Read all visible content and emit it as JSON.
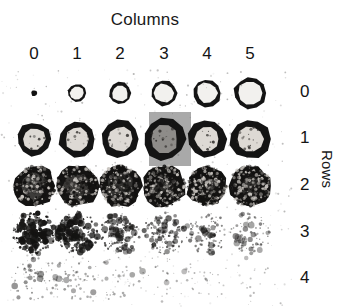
{
  "figure": {
    "width": 340,
    "height": 308,
    "background": "#ffffff",
    "ink": "#141414",
    "highlight_color": "#a9a9a9"
  },
  "axes": {
    "columns_title": "Columns",
    "rows_title": "Rows",
    "column_labels": [
      "0",
      "1",
      "2",
      "3",
      "4",
      "5"
    ],
    "row_labels": [
      "0",
      "1",
      "2",
      "3",
      "4"
    ]
  },
  "highlight": {
    "row": 1,
    "column": 3,
    "x": 149,
    "y": 112,
    "width": 42,
    "height": 54,
    "color": "#a9a9a9"
  },
  "layout": {
    "column_x": [
      34,
      77,
      120,
      164,
      207,
      250
    ],
    "column_label_y": 56,
    "row_y": [
      93,
      139,
      186,
      233,
      279
    ],
    "row_label_x": 300,
    "title_center_x": 165,
    "title_y": 22
  },
  "chart_data": {
    "type": "heatmap",
    "title": "Columns",
    "xlabel": "Columns",
    "ylabel": "Rows",
    "x": [
      "0",
      "1",
      "2",
      "3",
      "4",
      "5"
    ],
    "y": [
      "0",
      "1",
      "2",
      "3",
      "4"
    ],
    "cells": [
      {
        "row": 0,
        "col": 0,
        "radius": 3,
        "style": "solid-dot",
        "intensity": 1.0,
        "speckle": 0
      },
      {
        "row": 0,
        "col": 1,
        "radius": 9,
        "style": "ring",
        "intensity": 0.9,
        "speckle": 0
      },
      {
        "row": 0,
        "col": 2,
        "radius": 11,
        "style": "ring",
        "intensity": 0.9,
        "speckle": 0
      },
      {
        "row": 0,
        "col": 3,
        "radius": 13,
        "style": "ring",
        "intensity": 0.9,
        "speckle": 0
      },
      {
        "row": 0,
        "col": 4,
        "radius": 14,
        "style": "ring",
        "intensity": 0.9,
        "speckle": 0
      },
      {
        "row": 0,
        "col": 5,
        "radius": 16,
        "style": "ring",
        "intensity": 0.9,
        "speckle": 0
      },
      {
        "row": 1,
        "col": 0,
        "radius": 17,
        "style": "thick-ring",
        "intensity": 1.0,
        "speckle": 6
      },
      {
        "row": 1,
        "col": 1,
        "radius": 18,
        "style": "thick-ring",
        "intensity": 1.0,
        "speckle": 8
      },
      {
        "row": 1,
        "col": 2,
        "radius": 19,
        "style": "thick-ring",
        "intensity": 1.0,
        "speckle": 10
      },
      {
        "row": 1,
        "col": 3,
        "radius": 21,
        "style": "thick-ring",
        "intensity": 1.0,
        "speckle": 14
      },
      {
        "row": 1,
        "col": 4,
        "radius": 19,
        "style": "thick-ring",
        "intensity": 1.0,
        "speckle": 12
      },
      {
        "row": 1,
        "col": 5,
        "radius": 20,
        "style": "thick-ring",
        "intensity": 1.0,
        "speckle": 18
      },
      {
        "row": 2,
        "col": 0,
        "radius": 21,
        "style": "mottled",
        "intensity": 0.85,
        "speckle": 45
      },
      {
        "row": 2,
        "col": 1,
        "radius": 21,
        "style": "mottled",
        "intensity": 0.88,
        "speckle": 50
      },
      {
        "row": 2,
        "col": 2,
        "radius": 21,
        "style": "mottled",
        "intensity": 0.92,
        "speckle": 60
      },
      {
        "row": 2,
        "col": 3,
        "radius": 21,
        "style": "mottled",
        "intensity": 0.95,
        "speckle": 75
      },
      {
        "row": 2,
        "col": 4,
        "radius": 20,
        "style": "mottled",
        "intensity": 0.97,
        "speckle": 85
      },
      {
        "row": 2,
        "col": 5,
        "radius": 21,
        "style": "mottled",
        "intensity": 0.93,
        "speckle": 70
      },
      {
        "row": 3,
        "col": 0,
        "radius": 21,
        "style": "speckle",
        "intensity": 0.75,
        "speckle": 210
      },
      {
        "row": 3,
        "col": 1,
        "radius": 21,
        "style": "speckle",
        "intensity": 0.6,
        "speckle": 180
      },
      {
        "row": 3,
        "col": 2,
        "radius": 21,
        "style": "speckle",
        "intensity": 0.48,
        "speckle": 150
      },
      {
        "row": 3,
        "col": 3,
        "radius": 21,
        "style": "speckle",
        "intensity": 0.38,
        "speckle": 120
      },
      {
        "row": 3,
        "col": 4,
        "radius": 21,
        "style": "speckle",
        "intensity": 0.3,
        "speckle": 95
      },
      {
        "row": 3,
        "col": 5,
        "radius": 21,
        "style": "speckle",
        "intensity": 0.24,
        "speckle": 75
      },
      {
        "row": 4,
        "col": 0,
        "radius": 22,
        "style": "faint-speckle",
        "intensity": 0.2,
        "speckle": 60
      },
      {
        "row": 4,
        "col": 1,
        "radius": 22,
        "style": "faint-speckle",
        "intensity": 0.16,
        "speckle": 48
      },
      {
        "row": 4,
        "col": 2,
        "radius": 22,
        "style": "faint-speckle",
        "intensity": 0.12,
        "speckle": 36
      },
      {
        "row": 4,
        "col": 3,
        "radius": 22,
        "style": "faint-speckle",
        "intensity": 0.09,
        "speckle": 26
      },
      {
        "row": 4,
        "col": 4,
        "radius": 22,
        "style": "faint-speckle",
        "intensity": 0.07,
        "speckle": 18
      },
      {
        "row": 4,
        "col": 5,
        "radius": 22,
        "style": "faint-speckle",
        "intensity": 0.05,
        "speckle": 12
      }
    ]
  }
}
